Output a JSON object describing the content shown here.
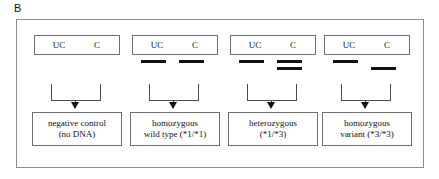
{
  "figure": {
    "panel_letter": "B",
    "lane_header_left": "UC",
    "lane_header_right": "C",
    "columns": [
      {
        "id": "negative-control",
        "lane_uc": "UC",
        "lane_c": "C",
        "bands": [],
        "result_line1": "negative control",
        "result_line2": "(no DNA)"
      },
      {
        "id": "homozygous-wild-type",
        "lane_uc": "UC",
        "lane_c": "C",
        "bands": [
          {
            "lane": "UC",
            "level": "upper"
          },
          {
            "lane": "C",
            "level": "upper"
          }
        ],
        "result_line1": "homozygous",
        "result_line2": "wild type (*1/*1)"
      },
      {
        "id": "heterozygous",
        "lane_uc": "UC",
        "lane_c": "C",
        "bands": [
          {
            "lane": "UC",
            "level": "upper"
          },
          {
            "lane": "C",
            "level": "upper"
          },
          {
            "lane": "C",
            "level": "lower"
          }
        ],
        "result_line1": "heterozygous",
        "result_line2": "(*1/*3)"
      },
      {
        "id": "homozygous-variant",
        "lane_uc": "UC",
        "lane_c": "C",
        "bands": [
          {
            "lane": "UC",
            "level": "upper"
          },
          {
            "lane": "C",
            "level": "lower"
          }
        ],
        "result_line1": "homozygous",
        "result_line2": "variant (*3/*3)"
      }
    ],
    "colors": {
      "band": "#111111",
      "frame": "#8d8d8d",
      "box_border": "#6f6f6f",
      "connector": "#4d4d4d",
      "text": "#111111",
      "background": "#ffffff"
    }
  }
}
